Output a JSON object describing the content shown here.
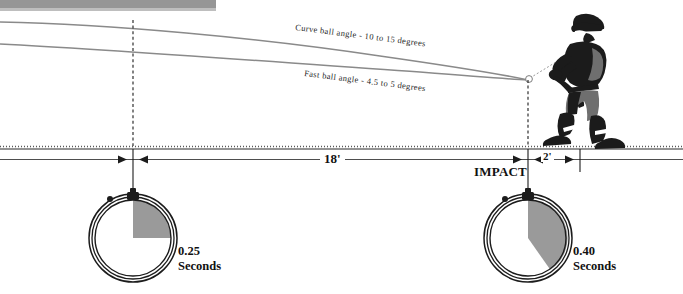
{
  "diagram": {
    "title_text_present": false,
    "labels": {
      "curve_ball": "Curve ball angle - 10 to 15 degrees",
      "fast_ball": "Fast ball angle - 4.5 to 5 degrees",
      "distance_main": "18'",
      "distance_impact": "2'",
      "impact": "IMPACT"
    },
    "timers": [
      {
        "name": "pitch-travel-timer",
        "value": "0.25",
        "unit": "Seconds",
        "wedge_degrees": 90
      },
      {
        "name": "impact-timer",
        "value": "0.40",
        "unit": "Seconds",
        "wedge_degrees": 144
      }
    ],
    "colors": {
      "trajectory": "#8a8a8a",
      "wedge": "#9a9a9a",
      "ink": "#1c1c1c",
      "scanbar": "#8e8e8e"
    }
  }
}
